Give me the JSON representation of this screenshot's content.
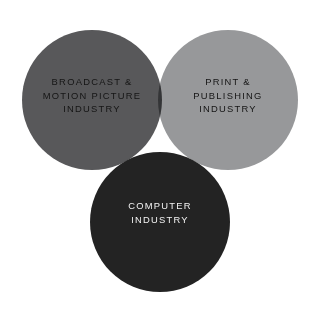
{
  "diagram": {
    "type": "venn",
    "background_color": "#ffffff",
    "width": 321,
    "height": 315,
    "sets": [
      {
        "id": "broadcast",
        "label": "BROADCAST &\nMOTION PICTURE\nINDUSTRY",
        "label_lines": [
          "BROADCAST &",
          "MOTION PICTURE",
          "INDUSTRY"
        ],
        "fill_color": "#58585a",
        "text_color": "#151515",
        "position": "left"
      },
      {
        "id": "print",
        "label": "PRINT &\nPUBLISHING\nINDUSTRY",
        "label_lines": [
          "PRINT &",
          "PUBLISHING",
          "INDUSTRY"
        ],
        "fill_color": "#97989a",
        "text_color": "#151515",
        "position": "right"
      },
      {
        "id": "computer",
        "label": "COMPUTER\nINDUSTRY",
        "label_lines": [
          "COMPUTER",
          "INDUSTRY"
        ],
        "fill_color": "#232323",
        "text_color": "#f2f2f2",
        "position": "bottom"
      }
    ]
  }
}
